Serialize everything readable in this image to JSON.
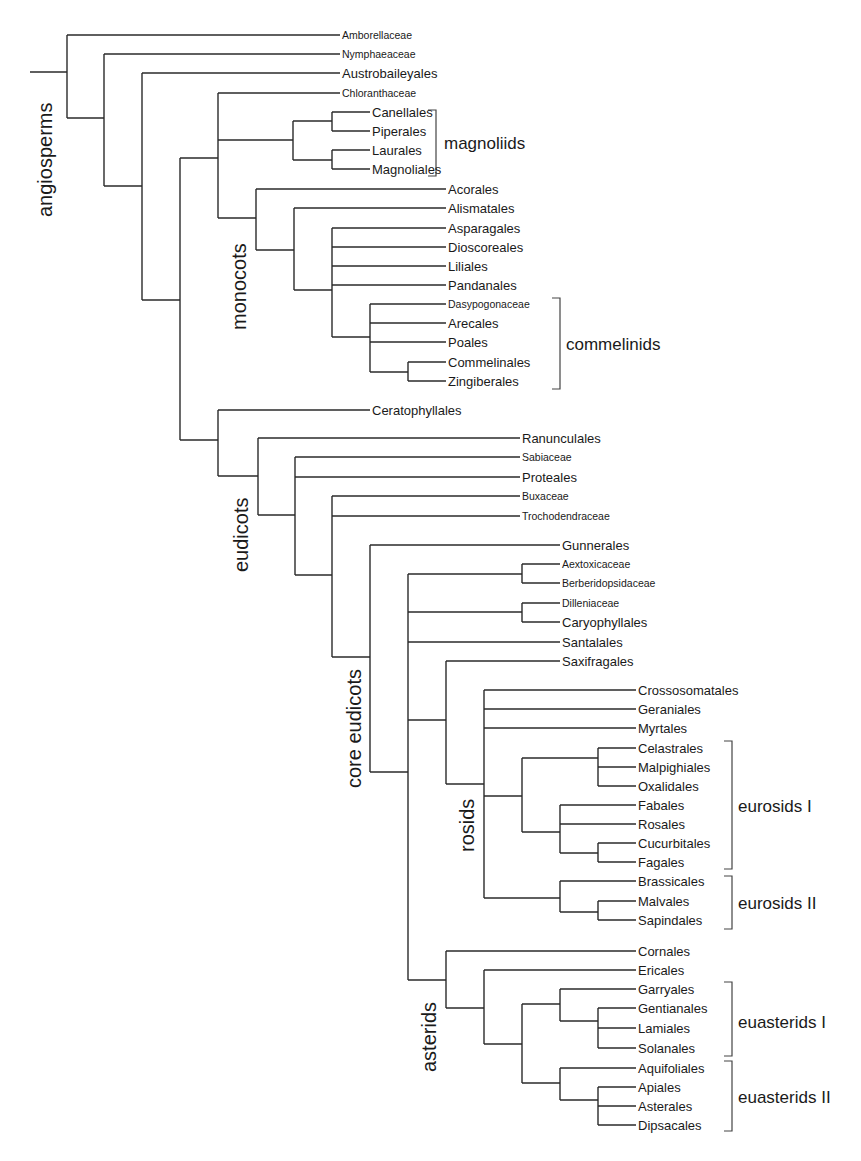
{
  "diagram": {
    "type": "cladogram",
    "clade_labels": {
      "angiosperms": "angiosperms",
      "monocots": "monocots",
      "eudicots": "eudicots",
      "core_eudicots": "core eudicots",
      "rosids": "rosids",
      "asterids": "asterids"
    },
    "group_brackets": {
      "magnoliids": "magnoliids",
      "commelinids": "commelinids",
      "eurosids_1": "eurosids I",
      "eurosids_2": "eurosids II",
      "euasterids_1": "euasterids I",
      "euasterids_2": "euasterids II"
    },
    "taxa": {
      "amborellaceae": "Amborellaceae",
      "nymphaeaceae": "Nymphaeaceae",
      "austrobaileyales": "Austrobaileyales",
      "chloranthaceae": "Chloranthaceae",
      "canellales": "Canellales",
      "piperales": "Piperales",
      "laurales": "Laurales",
      "magnoliales": "Magnoliales",
      "acorales": "Acorales",
      "alismatales": "Alismatales",
      "asparagales": "Asparagales",
      "dioscoreales": "Dioscoreales",
      "liliales": "Liliales",
      "pandanales": "Pandanales",
      "dasypogonaceae": "Dasypogonaceae",
      "arecales": "Arecales",
      "poales": "Poales",
      "commelinales": "Commelinales",
      "zingiberales": "Zingiberales",
      "ceratophyllales": "Ceratophyllales",
      "ranunculales": "Ranunculales",
      "sabiaceae": "Sabiaceae",
      "proteales": "Proteales",
      "buxaceae": "Buxaceae",
      "trochodendraceae": "Trochodendraceae",
      "gunnerales": "Gunnerales",
      "aextoxicaceae": "Aextoxicaceae",
      "berberidopsidaceae": "Berberidopsidaceae",
      "dilleniaceae": "Dilleniaceae",
      "caryophyllales": "Caryophyllales",
      "santalales": "Santalales",
      "saxifragales": "Saxifragales",
      "crossosomatales": "Crossosomatales",
      "geraniales": "Geraniales",
      "myrtales": "Myrtales",
      "celastrales": "Celastrales",
      "malpighiales": "Malpighiales",
      "oxalidales": "Oxalidales",
      "fabales": "Fabales",
      "rosales": "Rosales",
      "cucurbitales": "Cucurbitales",
      "fagales": "Fagales",
      "brassicales": "Brassicales",
      "malvales": "Malvales",
      "sapindales": "Sapindales",
      "cornales": "Cornales",
      "ericales": "Ericales",
      "garryales": "Garryales",
      "gentianales": "Gentianales",
      "lamiales": "Lamiales",
      "solanales": "Solanales",
      "aquifoliales": "Aquifoliales",
      "apiales": "Apiales",
      "asterales": "Asterales",
      "dipsacales": "Dipsacales"
    }
  }
}
